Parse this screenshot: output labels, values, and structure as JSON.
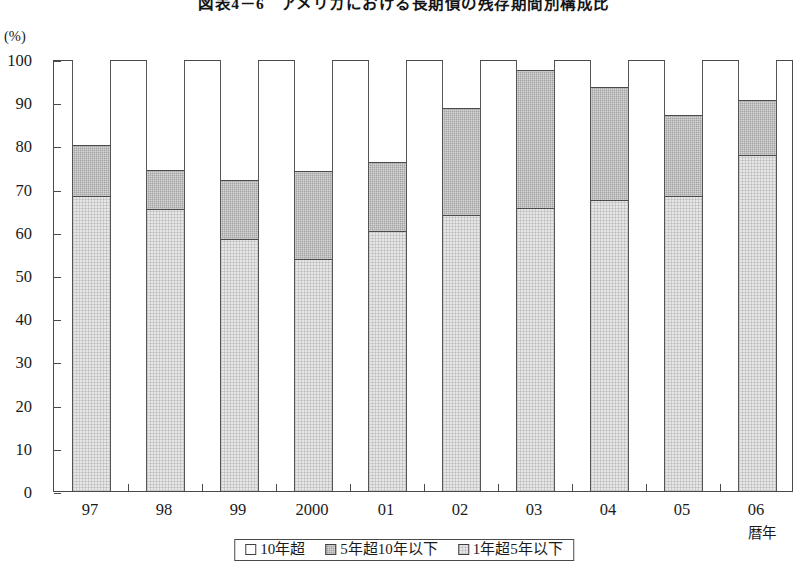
{
  "chart_data": {
    "type": "bar",
    "subtype": "stacked-percent-column",
    "title": "図表4－6　アメリカにおける長期債の残存期間別構成比",
    "unit_label": "(%)",
    "xlabel": "暦年",
    "ylabel": "",
    "categories": [
      "97",
      "98",
      "99",
      "2000",
      "01",
      "02",
      "03",
      "04",
      "05",
      "06"
    ],
    "ylim": [
      0,
      100
    ],
    "ytick_labels": [
      "0",
      "10",
      "20",
      "30",
      "40",
      "50",
      "60",
      "70",
      "80",
      "90",
      "100"
    ],
    "ytick_values": [
      0,
      10,
      20,
      30,
      40,
      50,
      60,
      70,
      80,
      90,
      100
    ],
    "grid": false,
    "legend_position": "bottom",
    "series": [
      {
        "name": "10年超",
        "color": "#ffffff",
        "swatch": "white",
        "values": [
          20.0,
          25.7,
          28.0,
          26.0,
          23.8,
          11.4,
          2.5,
          6.5,
          13.0,
          9.5
        ]
      },
      {
        "name": "5年超10年以下",
        "color": "#a3a3a3",
        "swatch": "darkgray",
        "values": [
          12.0,
          9.3,
          14.0,
          20.5,
          16.2,
          24.9,
          32.2,
          26.4,
          19.0,
          13.0
        ]
      },
      {
        "name": "1年超5年以下",
        "color": "#e6e6e6",
        "swatch": "lightgray",
        "values": [
          68.0,
          65.0,
          58.0,
          53.5,
          60.0,
          63.7,
          65.3,
          67.1,
          68.0,
          77.5
        ]
      }
    ],
    "cumulative_tops": {
      "1年超5年以下": [
        68.0,
        65.0,
        58.0,
        53.5,
        60.0,
        63.7,
        65.3,
        67.1,
        68.0,
        77.5
      ],
      "5年超10年以下": [
        80.0,
        74.3,
        72.0,
        74.0,
        76.2,
        88.6,
        97.5,
        93.5,
        87.0,
        90.5
      ],
      "10年超": [
        100,
        100,
        100,
        100,
        100,
        100,
        100,
        100,
        100,
        100
      ]
    }
  }
}
